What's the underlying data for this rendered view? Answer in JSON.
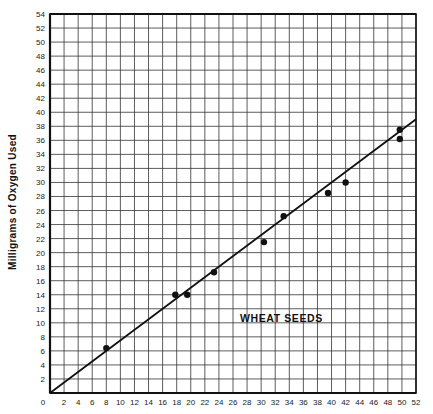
{
  "chart_data": {
    "type": "scatter",
    "title": "",
    "xlabel": "",
    "ylabel": "Milligrams of Oxygen Used",
    "annotation": "WHEAT SEEDS",
    "xlim": [
      0,
      52
    ],
    "ylim": [
      0,
      54
    ],
    "x_ticks": [
      0,
      2,
      4,
      6,
      8,
      10,
      12,
      14,
      16,
      18,
      20,
      22,
      24,
      26,
      28,
      30,
      32,
      34,
      36,
      38,
      40,
      42,
      44,
      46,
      48,
      50,
      52
    ],
    "y_ticks": [
      2,
      4,
      6,
      8,
      10,
      12,
      14,
      16,
      18,
      20,
      22,
      24,
      26,
      28,
      30,
      32,
      34,
      36,
      38,
      40,
      42,
      44,
      46,
      48,
      50,
      52,
      54
    ],
    "grid": true,
    "legend": null,
    "series": [
      {
        "name": "Wheat seeds (measured)",
        "type": "scatter",
        "points": [
          {
            "x": 8.0,
            "y": 6.4
          },
          {
            "x": 17.8,
            "y": 14.0
          },
          {
            "x": 19.5,
            "y": 14.0
          },
          {
            "x": 23.3,
            "y": 17.2
          },
          {
            "x": 30.4,
            "y": 21.5
          },
          {
            "x": 33.2,
            "y": 25.2
          },
          {
            "x": 39.5,
            "y": 28.5
          },
          {
            "x": 42.0,
            "y": 30.0
          },
          {
            "x": 49.7,
            "y": 37.5
          },
          {
            "x": 49.7,
            "y": 36.2
          }
        ]
      },
      {
        "name": "Best-fit line",
        "type": "line",
        "points": [
          {
            "x": 0,
            "y": 0
          },
          {
            "x": 52,
            "y": 39
          }
        ]
      }
    ]
  },
  "colors": {
    "ink": "#111111",
    "grid": "#333333",
    "background": "#ffffff"
  }
}
